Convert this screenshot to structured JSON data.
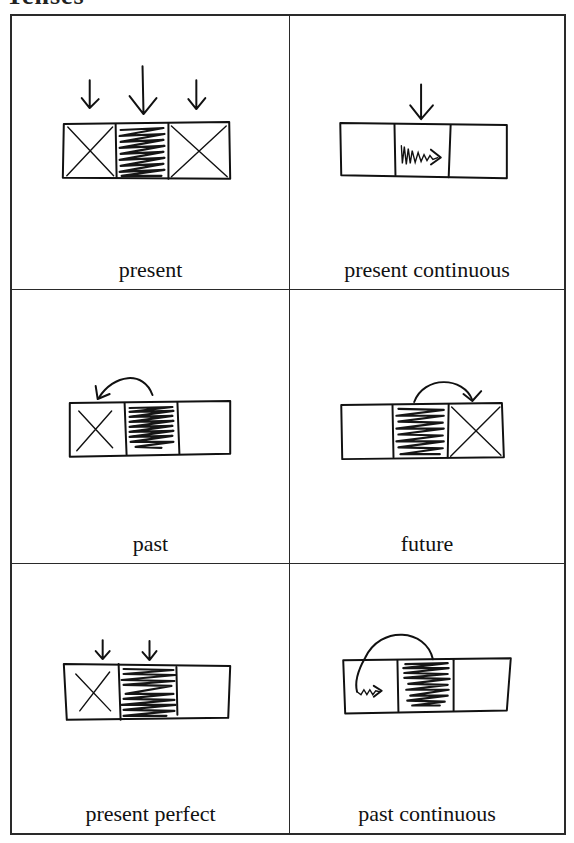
{
  "page": {
    "title_partial": "Tenses"
  },
  "grid": {
    "cells": [
      {
        "caption": "present",
        "diagram": {
          "boxes": [
            "crossed",
            "shaded",
            "crossed"
          ],
          "arrows": [
            "down-over-box-1",
            "down-over-box-2 (large)",
            "down-over-box-3"
          ]
        }
      },
      {
        "caption": "present continuous",
        "diagram": {
          "boxes": [
            "empty",
            "wavy-arrow-right",
            "empty"
          ],
          "arrows": [
            "down-over-box-2"
          ]
        }
      },
      {
        "caption": "past",
        "diagram": {
          "boxes": [
            "crossed",
            "shaded",
            "empty"
          ],
          "arrows": [
            "curved-from-box-2-to-box-1"
          ]
        }
      },
      {
        "caption": "future",
        "diagram": {
          "boxes": [
            "empty",
            "shaded",
            "crossed"
          ],
          "arrows": [
            "curved-from-box-2-to-box-3"
          ]
        }
      },
      {
        "caption": "present perfect",
        "diagram": {
          "boxes": [
            "crossed",
            "shaded",
            "empty"
          ],
          "arrows": [
            "down-over-box-1",
            "down-over-box-2"
          ]
        }
      },
      {
        "caption": "past continuous",
        "diagram": {
          "boxes": [
            "wavy-arrow-right",
            "shaded",
            "empty"
          ],
          "arrows": [
            "curved-from-box-2-to-box-1"
          ]
        }
      }
    ]
  },
  "colors": {
    "ink": "#111111",
    "border": "#2a2a2a",
    "background": "#ffffff"
  }
}
